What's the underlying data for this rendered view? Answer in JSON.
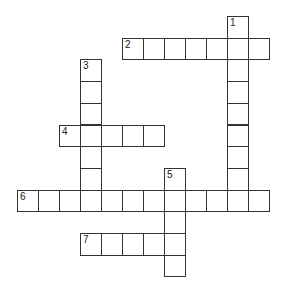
{
  "puzzle": {
    "type": "crossword",
    "cell_w": 21,
    "cell_h": 21.7,
    "origin_x": 17,
    "origin_y": 16,
    "colors": {
      "border": "#333333",
      "cell": "#ffffff",
      "number": "#222222"
    },
    "words": [
      {
        "number": "1",
        "direction": "down",
        "row": 0,
        "col": 10,
        "length": 9
      },
      {
        "number": "2",
        "direction": "across",
        "row": 1,
        "col": 5,
        "length": 7
      },
      {
        "number": "3",
        "direction": "down",
        "row": 2,
        "col": 3,
        "length": 7
      },
      {
        "number": "4",
        "direction": "across",
        "row": 5,
        "col": 2,
        "length": 5
      },
      {
        "number": "5",
        "direction": "down",
        "row": 7,
        "col": 7,
        "length": 5
      },
      {
        "number": "6",
        "direction": "across",
        "row": 8,
        "col": 0,
        "length": 12
      },
      {
        "number": "7",
        "direction": "across",
        "row": 10,
        "col": 3,
        "length": 5
      }
    ]
  }
}
